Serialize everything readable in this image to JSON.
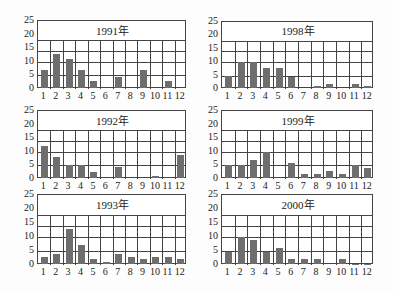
{
  "chart_data": [
    {
      "type": "bar",
      "title": "1991年",
      "categories": [
        "1",
        "2",
        "3",
        "4",
        "5",
        "6",
        "7",
        "8",
        "9",
        "10",
        "11",
        "12"
      ],
      "values": [
        7,
        13,
        11,
        7,
        3,
        0,
        4.5,
        0,
        7,
        0,
        3,
        0
      ],
      "ylim": [
        0,
        25
      ],
      "yticks": [
        0,
        5,
        10,
        15,
        20,
        25
      ],
      "grid": true
    },
    {
      "type": "bar",
      "title": "1992年",
      "categories": [
        "1",
        "2",
        "3",
        "4",
        "5",
        "6",
        "7",
        "8",
        "9",
        "10",
        "11",
        "12"
      ],
      "values": [
        12,
        8,
        5,
        5,
        2.5,
        0,
        4.5,
        0,
        0,
        1,
        0,
        9
      ],
      "ylim": [
        0,
        25
      ],
      "yticks": [
        0,
        5,
        10,
        15,
        20,
        25
      ],
      "grid": true
    },
    {
      "type": "bar",
      "title": "1993年",
      "categories": [
        "1",
        "2",
        "3",
        "4",
        "5",
        "6",
        "7",
        "8",
        "9",
        "10",
        "11",
        "12"
      ],
      "values": [
        3,
        4,
        13,
        7,
        2,
        1,
        4,
        3,
        2,
        3,
        3,
        2
      ],
      "ylim": [
        0,
        25
      ],
      "yticks": [
        0,
        5,
        10,
        15,
        20,
        25
      ],
      "grid": true
    },
    {
      "type": "bar",
      "title": "1998年",
      "categories": [
        "1",
        "2",
        "3",
        "4",
        "5",
        "6",
        "7",
        "8",
        "9",
        "10",
        "11",
        "12"
      ],
      "values": [
        5,
        10,
        10,
        8,
        8,
        4.5,
        0,
        1,
        2,
        0,
        2,
        1
      ],
      "ylim": [
        0,
        25
      ],
      "yticks": [
        0,
        5,
        10,
        15,
        20,
        25
      ],
      "grid": true
    },
    {
      "type": "bar",
      "title": "1999年",
      "categories": [
        "1",
        "2",
        "3",
        "4",
        "5",
        "6",
        "7",
        "8",
        "9",
        "10",
        "11",
        "12"
      ],
      "values": [
        5,
        5,
        7,
        10,
        0,
        6,
        2,
        2,
        3,
        2,
        5,
        4
      ],
      "ylim": [
        0,
        25
      ],
      "yticks": [
        0,
        5,
        10,
        15,
        20,
        25
      ],
      "grid": true
    },
    {
      "type": "bar",
      "title": "2000年",
      "categories": [
        "1",
        "2",
        "3",
        "4",
        "5",
        "6",
        "7",
        "8",
        "9",
        "10",
        "11",
        "12"
      ],
      "values": [
        4.5,
        10,
        9,
        4.5,
        6,
        2,
        2,
        2,
        0,
        2,
        0.5,
        0.5
      ],
      "ylim": [
        0,
        25
      ],
      "yticks": [
        0,
        5,
        10,
        15,
        20,
        25
      ],
      "grid": true
    }
  ],
  "layout": {
    "panels": [
      {
        "left": 37,
        "top": 20,
        "right": 186,
        "bottom": 88
      },
      {
        "left": 37,
        "top": 110,
        "right": 186,
        "bottom": 178
      },
      {
        "left": 37,
        "top": 194,
        "right": 186,
        "bottom": 264
      },
      {
        "left": 221,
        "top": 21,
        "right": 373,
        "bottom": 88
      },
      {
        "left": 221,
        "top": 110,
        "right": 373,
        "bottom": 178
      },
      {
        "left": 221,
        "top": 194,
        "right": 373,
        "bottom": 264
      }
    ],
    "gridlines": [
      5,
      10,
      14,
      18
    ],
    "colors": {
      "bar": "#6e6e6e",
      "grid": "#444444"
    }
  }
}
